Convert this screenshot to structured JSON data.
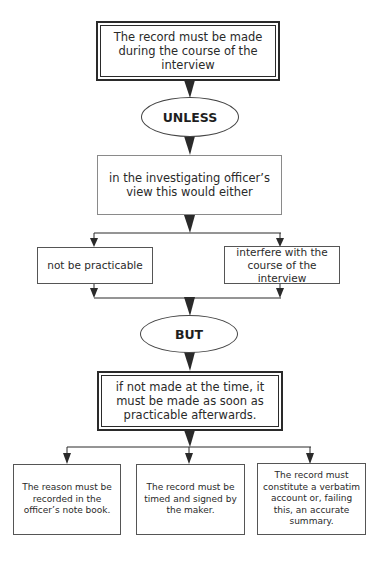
{
  "diagram": {
    "type": "flowchart",
    "nodes": {
      "start": {
        "shape": "double-box",
        "text": "The record must be made during the course of the interview"
      },
      "unless": {
        "shape": "ellipse",
        "text": "UNLESS"
      },
      "condition": {
        "shape": "box",
        "text": "in the investigating officer’s view this would either"
      },
      "option_left": {
        "shape": "box",
        "text": "not be practicable"
      },
      "option_right": {
        "shape": "box",
        "text": "interfere with the course of the interview"
      },
      "but": {
        "shape": "ellipse",
        "text": "BUT"
      },
      "fallback": {
        "shape": "double-box",
        "text": "if not made at the time, it must be made as soon as practicable afterwards."
      },
      "req_1": {
        "shape": "box",
        "text": "The reason must be recorded in the officer’s note book."
      },
      "req_2": {
        "shape": "box",
        "text": "The record must be timed and signed by the maker."
      },
      "req_3": {
        "shape": "box",
        "text": "The record must constitute a verbatim account or, failing this, an accurate summary."
      }
    },
    "edges": [
      [
        "start",
        "unless"
      ],
      [
        "unless",
        "condition"
      ],
      [
        "condition",
        "option_left"
      ],
      [
        "condition",
        "option_right"
      ],
      [
        "option_left",
        "but"
      ],
      [
        "option_right",
        "but"
      ],
      [
        "but",
        "fallback"
      ],
      [
        "fallback",
        "req_1"
      ],
      [
        "fallback",
        "req_2"
      ],
      [
        "fallback",
        "req_3"
      ]
    ],
    "colors": {
      "line": "#2a2a2a",
      "text": "#2a2a2a",
      "light_border": "#8a8a8a"
    }
  }
}
